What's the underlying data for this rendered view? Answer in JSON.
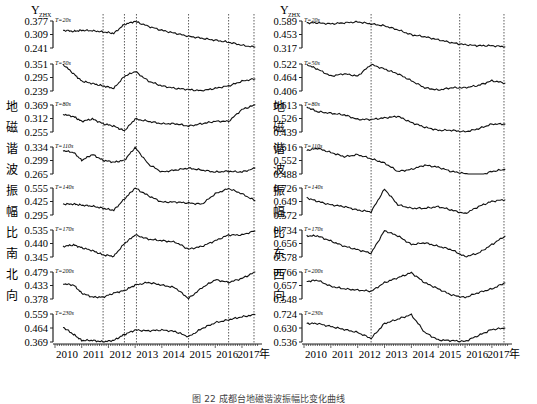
{
  "caption": "图 22  成都台地磁谐波振幅比变化曲线",
  "chart_data": [
    {
      "type": "line",
      "title": "地磁谐波振幅比南北向",
      "ylabel": "Y_ZHX",
      "side_label": [
        "地",
        "磁",
        "谐",
        "波",
        "振",
        "幅",
        "比",
        "南",
        "北",
        "向"
      ],
      "x_ticks": [
        "2010",
        "2011",
        "2012",
        "2013",
        "2014",
        "2015",
        "2016",
        "2017年"
      ],
      "x_range": [
        2010,
        2017.6
      ],
      "annotations": {
        "lushan": "芦山7.0级",
        "jiuzhaigou": "九寨沟7.0级"
      },
      "vlines_year": [
        2011.8,
        2012.6,
        2013.05,
        2015.0,
        2016.5,
        2017.45
      ],
      "series": [
        {
          "name": "T=20s",
          "ticks": [
            "0.377",
            "0.309",
            "0.241"
          ],
          "ylim": [
            0.241,
            0.377
          ],
          "x": [
            2010.3,
            2010.7,
            2011.0,
            2011.4,
            2011.8,
            2012.2,
            2012.6,
            2013.0,
            2013.5,
            2014,
            2014.5,
            2015,
            2015.5,
            2016,
            2016.5,
            2017,
            2017.5
          ],
          "y": [
            0.33,
            0.325,
            0.33,
            0.328,
            0.322,
            0.315,
            0.36,
            0.375,
            0.35,
            0.33,
            0.315,
            0.3,
            0.29,
            0.28,
            0.27,
            0.255,
            0.245
          ]
        },
        {
          "name": "T=50s",
          "ticks": [
            "0.351",
            "0.295",
            "0.239"
          ],
          "ylim": [
            0.239,
            0.351
          ],
          "x": [
            2010.3,
            2010.7,
            2011.0,
            2011.4,
            2011.8,
            2012.2,
            2012.6,
            2013.0,
            2013.5,
            2014,
            2014.5,
            2015,
            2015.5,
            2016,
            2016.5,
            2017,
            2017.5
          ],
          "y": [
            0.35,
            0.31,
            0.28,
            0.27,
            0.26,
            0.25,
            0.3,
            0.32,
            0.28,
            0.26,
            0.25,
            0.245,
            0.24,
            0.25,
            0.26,
            0.28,
            0.29
          ]
        },
        {
          "name": "T=80s",
          "ticks": [
            "0.369",
            "0.312",
            "0.255"
          ],
          "ylim": [
            0.255,
            0.369
          ],
          "x": [
            2010.3,
            2010.7,
            2011.0,
            2011.4,
            2011.8,
            2012.2,
            2012.6,
            2013.0,
            2013.5,
            2014,
            2014.5,
            2015,
            2015.5,
            2016,
            2016.5,
            2017,
            2017.5
          ],
          "y": [
            0.33,
            0.32,
            0.3,
            0.31,
            0.29,
            0.28,
            0.26,
            0.31,
            0.3,
            0.29,
            0.29,
            0.28,
            0.29,
            0.3,
            0.3,
            0.35,
            0.37
          ]
        },
        {
          "name": "T=110s",
          "ticks": [
            "0.334",
            "0.299",
            "0.265"
          ],
          "ylim": [
            0.265,
            0.334
          ],
          "x": [
            2010.3,
            2010.7,
            2011.0,
            2011.4,
            2011.8,
            2012.2,
            2012.6,
            2013.0,
            2013.5,
            2014,
            2014.5,
            2015,
            2015.5,
            2016,
            2016.5,
            2017,
            2017.5
          ],
          "y": [
            0.325,
            0.32,
            0.3,
            0.315,
            0.3,
            0.295,
            0.3,
            0.333,
            0.29,
            0.27,
            0.275,
            0.28,
            0.275,
            0.27,
            0.272,
            0.27,
            0.28
          ]
        },
        {
          "name": "T=140s",
          "ticks": [
            "0.555",
            "0.425",
            "0.295"
          ],
          "ylim": [
            0.295,
            0.555
          ],
          "x": [
            2010.3,
            2010.7,
            2011.0,
            2011.4,
            2011.8,
            2012.2,
            2012.6,
            2013.0,
            2013.5,
            2014,
            2014.5,
            2015,
            2015.5,
            2016,
            2016.5,
            2017,
            2017.5
          ],
          "y": [
            0.4,
            0.4,
            0.39,
            0.38,
            0.36,
            0.34,
            0.45,
            0.555,
            0.48,
            0.42,
            0.42,
            0.41,
            0.4,
            0.5,
            0.55,
            0.5,
            0.43
          ]
        },
        {
          "name": "T=170s",
          "ticks": [
            "0.535",
            "0.440",
            "0.345"
          ],
          "ylim": [
            0.345,
            0.535
          ],
          "x": [
            2010.3,
            2010.7,
            2011.0,
            2011.4,
            2011.8,
            2012.2,
            2012.6,
            2013.0,
            2013.5,
            2014,
            2014.5,
            2015,
            2015.5,
            2016,
            2016.5,
            2017,
            2017.5
          ],
          "y": [
            0.42,
            0.43,
            0.41,
            0.39,
            0.36,
            0.35,
            0.44,
            0.5,
            0.47,
            0.46,
            0.45,
            0.4,
            0.42,
            0.46,
            0.5,
            0.5,
            0.53
          ]
        },
        {
          "name": "T=200s",
          "ticks": [
            "0.479",
            "0.433",
            "0.378"
          ],
          "ylim": [
            0.378,
            0.479
          ],
          "x": [
            2010.3,
            2010.7,
            2011.0,
            2011.4,
            2011.8,
            2012.2,
            2012.6,
            2013.0,
            2013.5,
            2014,
            2014.5,
            2015,
            2015.5,
            2016,
            2016.5,
            2017,
            2017.5
          ],
          "y": [
            0.435,
            0.43,
            0.4,
            0.385,
            0.385,
            0.4,
            0.41,
            0.43,
            0.44,
            0.43,
            0.42,
            0.38,
            0.42,
            0.45,
            0.44,
            0.455,
            0.479
          ]
        },
        {
          "name": "T=230s",
          "ticks": [
            "0.559",
            "0.464",
            "0.369"
          ],
          "ylim": [
            0.369,
            0.559
          ],
          "x": [
            2010.3,
            2010.7,
            2011.0,
            2011.4,
            2011.8,
            2012.2,
            2012.6,
            2013.0,
            2013.5,
            2014,
            2014.5,
            2015,
            2015.5,
            2016,
            2016.5,
            2017,
            2017.5
          ],
          "y": [
            0.47,
            0.42,
            0.38,
            0.38,
            0.37,
            0.38,
            0.42,
            0.45,
            0.445,
            0.45,
            0.44,
            0.405,
            0.46,
            0.5,
            0.52,
            0.54,
            0.555
          ]
        }
      ]
    },
    {
      "type": "line",
      "title": "地磁谐波振幅比东西向",
      "ylabel": "Y_ZHX",
      "side_label": [
        "地",
        "磁",
        "谐",
        "波",
        "振",
        "幅",
        "比",
        "东",
        "西",
        "向"
      ],
      "x_ticks": [
        "2010",
        "2011",
        "2012",
        "2013",
        "2014",
        "2015",
        "2016",
        "2017年"
      ],
      "x_range": [
        2010,
        2017.6
      ],
      "annotations": {
        "lushan": "芦山7.0级",
        "jiuzhaigou": "九寨沟7.0级"
      },
      "vlines_year": [
        2012.5,
        2015.8,
        2017.45
      ],
      "series": [
        {
          "name": "T=20s",
          "ticks": [
            "0.589",
            "0.453",
            "0.317"
          ],
          "ylim": [
            0.317,
            0.589
          ],
          "x": [
            2010.1,
            2010.5,
            2011,
            2011.5,
            2012,
            2012.5,
            2013,
            2013.5,
            2014,
            2014.5,
            2015,
            2015.5,
            2016,
            2016.5,
            2017,
            2017.5
          ],
          "y": [
            0.57,
            0.57,
            0.56,
            0.57,
            0.58,
            0.56,
            0.54,
            0.5,
            0.45,
            0.43,
            0.4,
            0.37,
            0.35,
            0.34,
            0.34,
            0.33
          ]
        },
        {
          "name": "T=50s",
          "ticks": [
            "0.522",
            "0.464",
            "0.406"
          ],
          "ylim": [
            0.406,
            0.522
          ],
          "x": [
            2010.1,
            2010.5,
            2011,
            2011.5,
            2012,
            2012.5,
            2013,
            2013.5,
            2014,
            2014.5,
            2015,
            2015.5,
            2016,
            2016.5,
            2017,
            2017.5
          ],
          "y": [
            0.52,
            0.5,
            0.47,
            0.48,
            0.47,
            0.52,
            0.5,
            0.48,
            0.45,
            0.42,
            0.41,
            0.42,
            0.42,
            0.43,
            0.45,
            0.44
          ]
        },
        {
          "name": "T=80s",
          "ticks": [
            "0.613",
            "0.526",
            "0.439"
          ],
          "ylim": [
            0.439,
            0.613
          ],
          "x": [
            2010.1,
            2010.5,
            2011,
            2011.5,
            2012,
            2012.5,
            2013,
            2013.5,
            2014,
            2014.5,
            2015,
            2015.5,
            2016,
            2016.5,
            2017,
            2017.5
          ],
          "y": [
            0.6,
            0.57,
            0.56,
            0.55,
            0.52,
            0.52,
            0.53,
            0.54,
            0.5,
            0.47,
            0.45,
            0.45,
            0.44,
            0.46,
            0.49,
            0.49
          ]
        },
        {
          "name": "T=110s",
          "ticks": [
            "0.616",
            "0.552",
            "0.488"
          ],
          "ylim": [
            0.488,
            0.616
          ],
          "x": [
            2010.1,
            2010.5,
            2011,
            2011.5,
            2012,
            2012.5,
            2013,
            2013.5,
            2014,
            2014.5,
            2015,
            2015.5,
            2016,
            2016.5,
            2017,
            2017.5
          ],
          "y": [
            0.6,
            0.61,
            0.59,
            0.57,
            0.58,
            0.56,
            0.54,
            0.5,
            0.51,
            0.53,
            0.52,
            0.5,
            0.49,
            0.48,
            0.5,
            0.51
          ]
        },
        {
          "name": "T=140s",
          "ticks": [
            "0.726",
            "0.649",
            "0.572"
          ],
          "ylim": [
            0.572,
            0.726
          ],
          "x": [
            2010.1,
            2010.5,
            2011,
            2011.5,
            2012,
            2012.5,
            2013,
            2013.5,
            2014,
            2014.5,
            2015,
            2015.5,
            2016,
            2016.5,
            2017,
            2017.5
          ],
          "y": [
            0.67,
            0.65,
            0.63,
            0.62,
            0.6,
            0.59,
            0.72,
            0.63,
            0.61,
            0.61,
            0.62,
            0.6,
            0.58,
            0.62,
            0.65,
            0.66
          ]
        },
        {
          "name": "T=170s",
          "ticks": [
            "0.734",
            "0.656",
            "0.578"
          ],
          "ylim": [
            0.578,
            0.734
          ],
          "x": [
            2010.1,
            2010.5,
            2011,
            2011.5,
            2012,
            2012.5,
            2013,
            2013.5,
            2014,
            2014.5,
            2015,
            2015.5,
            2016,
            2016.5,
            2017,
            2017.5
          ],
          "y": [
            0.7,
            0.7,
            0.67,
            0.64,
            0.62,
            0.6,
            0.73,
            0.7,
            0.65,
            0.66,
            0.64,
            0.62,
            0.58,
            0.6,
            0.65,
            0.7
          ]
        },
        {
          "name": "T=200s",
          "ticks": [
            "0.766",
            "0.657",
            "0.548"
          ],
          "ylim": [
            0.548,
            0.766
          ],
          "x": [
            2010.1,
            2010.5,
            2011,
            2011.5,
            2012,
            2012.5,
            2013,
            2013.5,
            2014,
            2014.5,
            2015,
            2015.5,
            2016,
            2016.5,
            2017,
            2017.5
          ],
          "y": [
            0.69,
            0.7,
            0.65,
            0.63,
            0.62,
            0.61,
            0.68,
            0.72,
            0.76,
            0.68,
            0.63,
            0.58,
            0.56,
            0.6,
            0.63,
            0.68
          ]
        },
        {
          "name": "T=230s",
          "ticks": [
            "0.724",
            "0.630",
            "0.536"
          ],
          "ylim": [
            0.536,
            0.724
          ],
          "x": [
            2010.1,
            2010.5,
            2011,
            2011.5,
            2012,
            2012.5,
            2013,
            2013.5,
            2014,
            2014.5,
            2015,
            2015.5,
            2016,
            2016.5,
            2017,
            2017.5
          ],
          "y": [
            0.66,
            0.66,
            0.64,
            0.62,
            0.6,
            0.56,
            0.66,
            0.69,
            0.72,
            0.6,
            0.55,
            0.545,
            0.54,
            0.58,
            0.62,
            0.63
          ]
        }
      ]
    }
  ]
}
